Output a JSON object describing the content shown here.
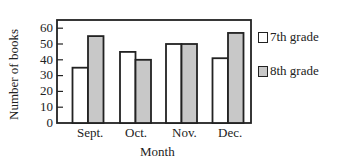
{
  "chart_data": {
    "type": "bar",
    "title": "",
    "xlabel": "Month",
    "ylabel": "Number of books",
    "categories": [
      "Sept.",
      "Oct.",
      "Nov.",
      "Dec."
    ],
    "series": [
      {
        "name": "7th grade",
        "values": [
          35,
          45,
          50,
          41
        ],
        "color": "#ffffff"
      },
      {
        "name": "8th grade",
        "values": [
          55,
          40,
          50,
          57
        ],
        "color": "#c8c8c8"
      }
    ],
    "ylim": [
      0,
      65
    ],
    "yticks": [
      0,
      10,
      20,
      30,
      40,
      50,
      60
    ],
    "grid": false,
    "legend_position": "right"
  },
  "labels": {
    "xlabel": "Month",
    "ylabel": "Number of books",
    "legend": [
      "7th grade",
      "8th grade"
    ],
    "categories": [
      "Sept.",
      "Oct.",
      "Nov.",
      "Dec."
    ],
    "yticks": [
      "0",
      "10",
      "20",
      "30",
      "40",
      "50",
      "60"
    ]
  }
}
